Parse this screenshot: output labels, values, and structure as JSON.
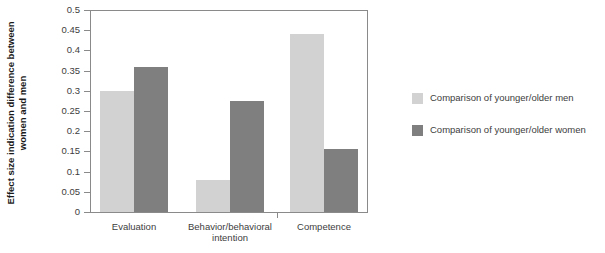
{
  "chart_data": {
    "type": "bar",
    "title": "",
    "xlabel": "",
    "ylabel": "Effect size indication difference between women and men",
    "ylabel_line1": "Effect size indication difference between",
    "ylabel_line2": "women and men",
    "categories": [
      "Evaluation",
      "Behavior/behavioral intention",
      "Competence"
    ],
    "category_labels": [
      {
        "line1": "Evaluation",
        "line2": ""
      },
      {
        "line1": "Behavior/behavioral",
        "line2": "intention"
      },
      {
        "line1": "Competence",
        "line2": ""
      }
    ],
    "series": [
      {
        "name": "Comparison of younger/older men",
        "color": "#d2d2d2",
        "values": [
          0.3,
          0.08,
          0.44
        ]
      },
      {
        "name": "Comparison of younger/older women",
        "color": "#7f7f7f",
        "values": [
          0.36,
          0.275,
          0.155
        ]
      }
    ],
    "ylim": [
      0,
      0.5
    ],
    "ytick_values": [
      0,
      0.05,
      0.1,
      0.15,
      0.2,
      0.25,
      0.3,
      0.35,
      0.4,
      0.45,
      0.5
    ],
    "ytick_labels": [
      "0",
      "0.05",
      "0.1",
      "0.15",
      "0.2",
      "0.25",
      "0.3",
      "0.35",
      "0.4",
      "0.45",
      "0.5"
    ],
    "grid": false,
    "legend_position": "right"
  },
  "legend": {
    "entries": [
      {
        "label": "Comparison of younger/older men",
        "swatch": "light-gray-swatch"
      },
      {
        "label": "Comparison of younger/older women",
        "swatch": "dark-gray-swatch"
      }
    ]
  },
  "colors": {
    "series_men": "#d2d2d2",
    "series_women": "#7f7f7f",
    "axis": "#8a8a8a",
    "text": "#3d3d3d",
    "title_text": "#1a1a1a",
    "background": "#ffffff"
  }
}
